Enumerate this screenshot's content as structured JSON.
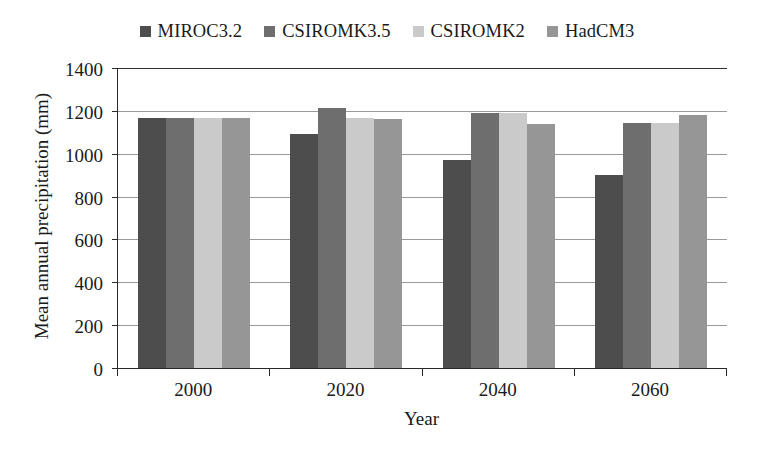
{
  "chart_data": {
    "type": "bar",
    "title": "",
    "xlabel": "Year",
    "ylabel": "Mean annual precipitation (mm)",
    "categories": [
      "2000",
      "2020",
      "2040",
      "2060"
    ],
    "ylim": [
      0,
      1400
    ],
    "yticks": [
      0,
      200,
      400,
      600,
      800,
      1000,
      1200,
      1400
    ],
    "ytick_labels": [
      "0",
      "200",
      "400",
      "600",
      "800",
      "1000",
      "1200",
      "1400"
    ],
    "grid": true,
    "legend_position": "top-center",
    "series": [
      {
        "name": "MIROC3.2",
        "color": "#4d4d4d",
        "values": [
          1165,
          1090,
          970,
          900
        ]
      },
      {
        "name": "CSIROMK3.5",
        "color": "#6e6e6e",
        "values": [
          1165,
          1215,
          1190,
          1145
        ]
      },
      {
        "name": "CSIROMK2",
        "color": "#cacaca",
        "values": [
          1165,
          1165,
          1190,
          1145
        ]
      },
      {
        "name": "HadCM3",
        "color": "#969696",
        "values": [
          1165,
          1160,
          1140,
          1180
        ]
      }
    ]
  }
}
